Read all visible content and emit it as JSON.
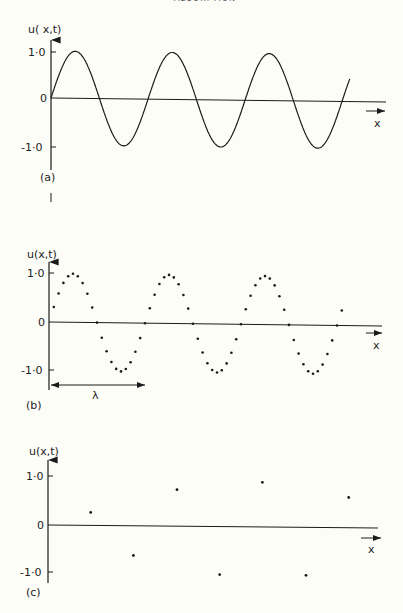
{
  "page": {
    "running_header": "ABSORPTION",
    "background": "#fdfdf8",
    "ink": "#1a1a1a"
  },
  "chart_data": [
    {
      "panel": "(a)",
      "type": "line",
      "title": "",
      "ylabel": "u( x,t)",
      "xlabel": "x",
      "yticks": [
        "1·0",
        "0",
        "-1·0"
      ],
      "ylim": [
        -1.0,
        1.0
      ],
      "grid": false,
      "description": "Continuous sine wave u(x,t) over about 3.1 wavelengths",
      "wavelengths_shown": 3.1,
      "x": [
        0,
        0.25,
        0.5,
        0.75,
        1.0,
        1.25,
        1.5,
        1.75,
        2.0,
        2.25,
        2.5,
        2.75,
        3.0,
        3.08
      ],
      "values": [
        0,
        1.0,
        0,
        -1.0,
        0,
        1.0,
        0,
        -1.0,
        0,
        1.0,
        0,
        -1.0,
        0,
        0.45
      ]
    },
    {
      "panel": "(b)",
      "type": "scatter",
      "title": "",
      "ylabel": "u(x,t)",
      "xlabel": "x",
      "yticks": [
        "1·0",
        "0",
        "-1·0"
      ],
      "ylim": [
        -1.0,
        1.0
      ],
      "grid": false,
      "annotation": "λ",
      "annotation_desc": "double-headed arrow spanning one wavelength below the axis",
      "description": "Sine wave sampled at ~20 points per wavelength",
      "samples_per_wavelength": 20,
      "x": [
        0.05,
        0.1,
        0.15,
        0.2,
        0.25,
        0.3,
        0.35,
        0.4,
        0.45,
        0.5,
        0.55,
        0.6,
        0.65,
        0.7,
        0.75,
        0.8,
        0.85,
        0.9,
        0.95,
        1.0,
        1.05,
        1.1,
        1.15,
        1.2,
        1.25,
        1.3,
        1.35,
        1.4,
        1.45,
        1.5,
        1.55,
        1.6,
        1.65,
        1.7,
        1.75,
        1.8,
        1.85,
        1.9,
        1.95,
        2.0,
        2.05,
        2.1,
        2.15,
        2.2,
        2.25,
        2.3,
        2.35,
        2.4,
        2.45,
        2.5,
        2.55,
        2.6,
        2.65,
        2.7,
        2.75,
        2.8,
        2.85,
        2.9,
        2.95,
        3.0,
        3.05
      ],
      "values": [
        0.31,
        0.59,
        0.81,
        0.95,
        1.0,
        0.95,
        0.81,
        0.59,
        0.31,
        0,
        -0.31,
        -0.59,
        -0.81,
        -0.95,
        -1.0,
        -0.95,
        -0.81,
        -0.59,
        -0.31,
        0,
        0.31,
        0.59,
        0.81,
        0.95,
        1.0,
        0.95,
        0.81,
        0.59,
        0.31,
        0,
        -0.31,
        -0.59,
        -0.81,
        -0.95,
        -1.0,
        -0.95,
        -0.81,
        -0.59,
        -0.31,
        0,
        0.31,
        0.59,
        0.81,
        0.95,
        1.0,
        0.95,
        0.81,
        0.59,
        0.31,
        0,
        -0.31,
        -0.59,
        -0.81,
        -0.95,
        -1.0,
        -0.95,
        -0.81,
        -0.59,
        -0.31,
        0,
        0.31
      ]
    },
    {
      "panel": "(c)",
      "type": "scatter",
      "title": "",
      "ylabel": "u(x,t)",
      "xlabel": "x",
      "yticks": [
        "1·0",
        "0",
        "-1·0"
      ],
      "ylim": [
        -1.0,
        1.0
      ],
      "grid": false,
      "description": "Same wave sparsely sampled (aliased), ~0.45 wavelength between samples",
      "x": [
        0.44,
        0.88,
        1.33,
        1.77,
        2.21,
        2.66,
        3.1
      ],
      "values": [
        0.27,
        -0.62,
        0.76,
        -1.0,
        0.93,
        -1.0,
        0.63
      ]
    }
  ],
  "panels": {
    "a": {
      "label": "(a)",
      "ylabel": "u( x,t)",
      "xlabel": "x",
      "tick_pos": "1·0",
      "tick_zero": "0",
      "tick_neg": "-1·0"
    },
    "b": {
      "label": "(b)",
      "ylabel": "u(x,t)",
      "xlabel": "x",
      "tick_pos": "1·0",
      "tick_zero": "0",
      "tick_neg": "-1·0",
      "lambda": "λ"
    },
    "c": {
      "label": "(c)",
      "ylabel": "u(x,t)",
      "xlabel": "x",
      "tick_pos": "1·0",
      "tick_zero": "0",
      "tick_neg": "-1·0"
    }
  }
}
